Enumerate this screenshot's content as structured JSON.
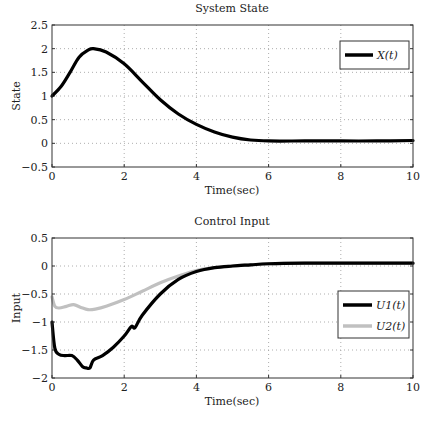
{
  "chart_data": [
    {
      "type": "line",
      "title": "System State",
      "xlabel": "Time(sec)",
      "ylabel": "State",
      "xlim": [
        0,
        10
      ],
      "ylim": [
        -0.5,
        2.5
      ],
      "xticks": [
        0,
        2,
        4,
        6,
        8,
        10
      ],
      "xtick_labels": [
        "0",
        "2",
        "4",
        "6",
        "8",
        "10"
      ],
      "yticks": [
        -0.5,
        0,
        0.5,
        1,
        1.5,
        2,
        2.5
      ],
      "ytick_labels": [
        "−0.5",
        "0",
        "0.5",
        "1",
        "1.5",
        "2",
        "2.5"
      ],
      "grid": true,
      "legend_position": "top-right",
      "series": [
        {
          "name": "X(t)",
          "color": "#000000",
          "x": [
            0,
            0.25,
            0.5,
            0.75,
            1.0,
            1.15,
            1.5,
            2.0,
            2.5,
            3.0,
            3.5,
            4.0,
            4.5,
            5.0,
            5.5,
            6.0,
            7.0,
            8.0,
            9.0,
            10.0
          ],
          "y": [
            1.0,
            1.2,
            1.5,
            1.82,
            1.97,
            2.0,
            1.93,
            1.68,
            1.3,
            0.92,
            0.62,
            0.4,
            0.24,
            0.13,
            0.07,
            0.05,
            0.05,
            0.05,
            0.05,
            0.06
          ]
        }
      ]
    },
    {
      "type": "line",
      "title": "Control Input",
      "xlabel": "Time(sec)",
      "ylabel": "Input",
      "xlim": [
        0,
        10
      ],
      "ylim": [
        -2,
        0.5
      ],
      "xticks": [
        0,
        2,
        4,
        6,
        8,
        10
      ],
      "xtick_labels": [
        "0",
        "2",
        "4",
        "6",
        "8",
        "10"
      ],
      "yticks": [
        -2,
        -1.5,
        -1,
        -0.5,
        0,
        0.5
      ],
      "ytick_labels": [
        "−2",
        "−1.5",
        "−1",
        "−0.5",
        "0",
        "0.5"
      ],
      "grid": true,
      "legend_position": "right",
      "series": [
        {
          "name": "U1(t)",
          "color": "#000000",
          "x": [
            0,
            0.08,
            0.2,
            0.35,
            0.55,
            0.7,
            0.85,
            0.95,
            1.05,
            1.15,
            1.4,
            1.7,
            2.0,
            2.2,
            2.3,
            2.5,
            3.0,
            3.5,
            4.0,
            4.5,
            5.0,
            5.5,
            6.0,
            7.0,
            8.0,
            9.0,
            10.0
          ],
          "y": [
            -1.0,
            -1.47,
            -1.58,
            -1.6,
            -1.6,
            -1.68,
            -1.8,
            -1.82,
            -1.82,
            -1.68,
            -1.6,
            -1.45,
            -1.25,
            -1.08,
            -1.1,
            -0.88,
            -0.5,
            -0.24,
            -0.1,
            -0.03,
            0.0,
            0.02,
            0.04,
            0.05,
            0.05,
            0.05,
            0.05
          ]
        },
        {
          "name": "U2(t)",
          "color": "#c0c0c0",
          "x": [
            0,
            0.08,
            0.2,
            0.4,
            0.6,
            0.8,
            1.0,
            1.2,
            1.5,
            2.0,
            2.5,
            3.0,
            3.5,
            4.0,
            4.5,
            5.0,
            5.5,
            6.0,
            7.0,
            8.0,
            9.0,
            10.0
          ],
          "y": [
            -0.55,
            -0.72,
            -0.75,
            -0.72,
            -0.69,
            -0.74,
            -0.78,
            -0.77,
            -0.72,
            -0.6,
            -0.45,
            -0.3,
            -0.18,
            -0.08,
            -0.03,
            0.0,
            0.02,
            0.04,
            0.05,
            0.05,
            0.05,
            0.05
          ]
        }
      ]
    }
  ]
}
